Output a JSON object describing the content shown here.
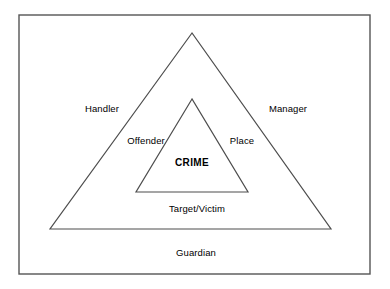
{
  "diagram": {
    "type": "crime-triangle",
    "frame": {
      "x": 19,
      "y": 15,
      "width": 351,
      "height": 259,
      "stroke": "#555555",
      "stroke_width": 1.4,
      "fill": "#ffffff"
    },
    "outer_triangle": {
      "name": "outer-triangle",
      "apex": {
        "x": 192,
        "y": 33
      },
      "bottom_left": {
        "x": 50,
        "y": 229
      },
      "bottom_right": {
        "x": 331,
        "y": 229
      },
      "stroke": "#4d4d4d",
      "stroke_width": 1.2,
      "fill": "none"
    },
    "inner_triangle": {
      "name": "inner-triangle",
      "apex": {
        "x": 192,
        "y": 99
      },
      "bottom_left": {
        "x": 136,
        "y": 192
      },
      "bottom_right": {
        "x": 248,
        "y": 192
      },
      "stroke": "#4d4d4d",
      "stroke_width": 1.2,
      "fill": "none"
    },
    "labels": {
      "handler": {
        "text": "Handler",
        "x": 102,
        "y": 108
      },
      "manager": {
        "text": "Manager",
        "x": 288,
        "y": 108
      },
      "offender": {
        "text": "Offender",
        "x": 146,
        "y": 140
      },
      "place": {
        "text": "Place",
        "x": 242,
        "y": 140
      },
      "crime": {
        "text": "CRIME",
        "x": 192,
        "y": 162
      },
      "target_victim": {
        "text": "Target/Victim",
        "x": 197,
        "y": 208
      },
      "guardian": {
        "text": "Guardian",
        "x": 196,
        "y": 252
      }
    }
  }
}
